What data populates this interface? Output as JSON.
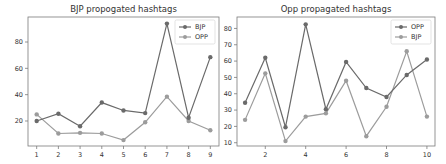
{
  "colors": {
    "series_dark": "#6a6a6a",
    "series_light": "#9c9c9c",
    "axis": "#7a7a7a",
    "text": "#333333"
  },
  "chart_data": [
    {
      "type": "line",
      "title": "BJP propogated hashtags",
      "xlabel": "",
      "ylabel": "",
      "x": [
        1,
        2,
        3,
        4,
        5,
        6,
        7,
        8,
        9
      ],
      "xticks": [
        1,
        2,
        3,
        4,
        5,
        6,
        7,
        8,
        9
      ],
      "yticks": [
        20,
        40,
        60,
        80
      ],
      "xlim": [
        0.6,
        9.4
      ],
      "ylim": [
        1,
        99
      ],
      "grid": false,
      "legend_position": "upper right",
      "series": [
        {
          "name": "BJP",
          "marker": "o",
          "values": [
            20,
            25.5,
            16,
            34,
            28,
            26,
            94,
            22.5,
            68.5
          ]
        },
        {
          "name": "OPP",
          "marker": "o",
          "values": [
            25,
            10.5,
            11,
            10.5,
            5.5,
            19,
            38.5,
            20,
            13
          ]
        }
      ]
    },
    {
      "type": "line",
      "title": "Opp propagated hashtags",
      "xlabel": "",
      "ylabel": "",
      "x": [
        1,
        2,
        3,
        4,
        5,
        6,
        7,
        8,
        9,
        10
      ],
      "xticks": [
        2,
        4,
        6,
        8,
        10
      ],
      "yticks": [
        10,
        20,
        30,
        40,
        50,
        60,
        70,
        80
      ],
      "xlim": [
        0.6,
        10.4
      ],
      "ylim": [
        8,
        87
      ],
      "grid": false,
      "legend_position": "upper right",
      "series": [
        {
          "name": "OPP",
          "marker": "o",
          "values": [
            34.5,
            62,
            19.5,
            82.5,
            30.5,
            59.5,
            43.5,
            38,
            51.5,
            61
          ]
        },
        {
          "name": "BJP",
          "marker": "o",
          "values": [
            24,
            52.5,
            11,
            26,
            28,
            48,
            14,
            32,
            66,
            26
          ]
        }
      ]
    }
  ]
}
